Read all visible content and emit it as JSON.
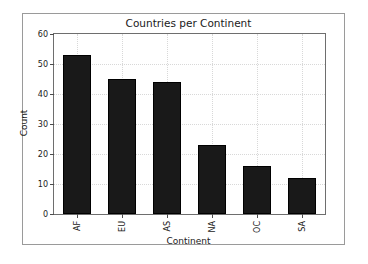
{
  "chart_data": {
    "type": "bar",
    "title": "Countries per Continent",
    "xlabel": "Continent",
    "ylabel": "Count",
    "categories": [
      "AF",
      "EU",
      "AS",
      "NA",
      "OC",
      "SA"
    ],
    "values": [
      53,
      45,
      44,
      23,
      16,
      12
    ],
    "series": [
      {
        "name": "Count",
        "values": [
          53,
          45,
          44,
          23,
          16,
          12
        ]
      }
    ],
    "ylim": [
      0,
      60
    ],
    "yticks": [
      0,
      10,
      20,
      30,
      40,
      50,
      60
    ],
    "ytick_labels": [
      "0",
      "10",
      "20",
      "30",
      "40",
      "50",
      "60"
    ],
    "xtick_labels": [
      "AF",
      "EU",
      "AS",
      "NA",
      "OC",
      "SA"
    ],
    "xtick_rotation": 90,
    "grid": true,
    "grid_style": "dotted",
    "legend": null,
    "legend_position": "none",
    "bar_color": "#191919",
    "bar_edge_color": "#000000",
    "grid_color": "#d8d8d8",
    "axes_color": "#6e6e6e",
    "figure_border_color": "#9a9a9a",
    "background_color": "#ffffff",
    "text_color": "#1a1a1a"
  }
}
